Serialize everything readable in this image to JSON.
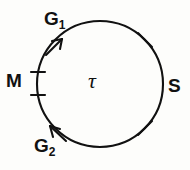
{
  "figure": {
    "kind": "cell-cycle-diagram",
    "background_color": "#fdfdfb",
    "ink_color": "#111111",
    "center_symbol": "τ",
    "direction": "clockwise"
  },
  "labels": {
    "g1": {
      "base": "G",
      "sub": "1"
    },
    "g2": {
      "base": "G",
      "sub": "2"
    },
    "m": "M",
    "s": "S",
    "tau": "τ"
  },
  "geometry": {
    "circle": {
      "cx": 100,
      "cy": 84,
      "r": 63,
      "stroke_width": 2.1
    },
    "arrowheads": [
      {
        "name": "g1-arrowhead",
        "angle_deg": 143,
        "points_toward": "clockwise"
      },
      {
        "name": "g2-arrowhead",
        "angle_deg": 217,
        "points_toward": "clockwise"
      }
    ],
    "tick_marks": [
      {
        "name": "tick-m-start",
        "angle_deg": 190,
        "style": "radial-short"
      },
      {
        "name": "tick-m-end",
        "angle_deg": 169,
        "style": "radial-short"
      },
      {
        "name": "tick-s-start",
        "angle_deg": 46,
        "style": "radial-short"
      },
      {
        "name": "tick-s-end",
        "angle_deg": 315,
        "style": "radial-short"
      }
    ]
  }
}
